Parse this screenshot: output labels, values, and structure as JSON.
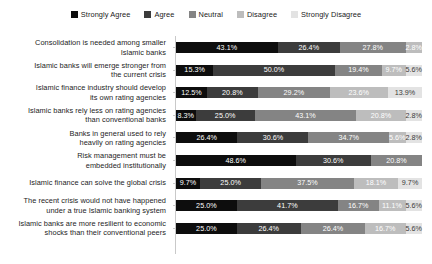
{
  "legend": {
    "position": "top",
    "items": [
      {
        "label": "Strongly Agree",
        "color": "#0d0d0d"
      },
      {
        "label": "Agree",
        "color": "#3c3c3c"
      },
      {
        "label": "Neutral",
        "color": "#848484"
      },
      {
        "label": "Disagree",
        "color": "#bdbdbd"
      },
      {
        "label": "Strongly Disagree",
        "color": "#e3e3e3"
      }
    ]
  },
  "chart_data": {
    "type": "bar",
    "orientation": "horizontal",
    "stacked": true,
    "stack_mode": "percent",
    "title": "",
    "subtitle": "",
    "xlabel": "",
    "ylabel": "",
    "xlim": [
      0,
      100
    ],
    "grid": false,
    "value_suffix": "%",
    "legend_position": "top",
    "categories": [
      "Consolidation is needed among smaller Islamic banks",
      "Islamic banks will emerge stronger from the current crisis",
      "Islamic finance industry should develop its own rating agencies",
      "Islamic banks rely less on rating agencies than conventional banks",
      "Banks in general used to rely heavily on rating agencies",
      "Risk management must be embedded institutionally",
      "Islamic finance can solve the global crisis",
      "The recent crisis would not have happened under a true Islamic banking system",
      "Islamic banks are more resilient to economic shocks than their conventional peers"
    ],
    "category_lines": [
      [
        "Consolidation is needed among smaller",
        "Islamic banks"
      ],
      [
        "Islamic banks will emerge stronger from",
        "the current crisis"
      ],
      [
        "Islamic finance industry should develop",
        "its own rating agencies"
      ],
      [
        "Islamic banks rely less on rating agencies",
        "than conventional banks"
      ],
      [
        "Banks in general used to rely",
        "heavily on rating agencies"
      ],
      [
        "Risk management must be",
        "embedded institutionally"
      ],
      [
        "Islamic finance can solve the global crisis",
        ""
      ],
      [
        "The recent crisis would not have happened",
        "under a true Islamic banking system"
      ],
      [
        "Islamic banks are more resilient to economic",
        "shocks than their conventional peers"
      ]
    ],
    "series": [
      {
        "name": "Strongly Agree",
        "color": "#0d0d0d",
        "label_color": "#ffffff",
        "values": [
          43.1,
          15.3,
          12.5,
          8.3,
          26.4,
          48.6,
          9.7,
          25.0,
          25.0
        ],
        "labels": [
          "43.1%",
          "15.3%",
          "12.5%",
          "8.3%",
          "26.4%",
          "48.6%",
          "9.7%",
          "25.0%",
          "25.0%"
        ]
      },
      {
        "name": "Agree",
        "color": "#3c3c3c",
        "label_color": "#ffffff",
        "values": [
          26.4,
          50.0,
          20.8,
          25.0,
          30.6,
          30.6,
          25.0,
          41.7,
          26.4
        ],
        "labels": [
          "26.4%",
          "50.0%",
          "20.8%",
          "25.0%",
          "30.6%",
          "30.6%",
          "25.0%",
          "41.7%",
          "26.4%"
        ]
      },
      {
        "name": "Neutral",
        "color": "#848484",
        "label_color": "#ffffff",
        "values": [
          27.8,
          19.4,
          29.2,
          43.1,
          34.7,
          20.8,
          37.5,
          16.7,
          26.4
        ],
        "labels": [
          "27.8%",
          "19.4%",
          "29.2%",
          "43.1%",
          "34.7%",
          "20.8%",
          "37.5%",
          "16.7%",
          "26.4%"
        ]
      },
      {
        "name": "Disagree",
        "color": "#bdbdbd",
        "label_color": "#ffffff",
        "values": [
          2.8,
          9.7,
          23.6,
          20.8,
          5.6,
          0,
          18.1,
          11.1,
          16.7
        ],
        "labels": [
          "2.8%",
          "9.7%",
          "23.6%",
          "20.8%",
          "5.6%",
          "",
          "18.1%",
          "11.1%",
          "16.7%"
        ]
      },
      {
        "name": "Strongly Disagree",
        "color": "#e3e3e3",
        "label_color": "#3a3a3a",
        "values": [
          0,
          5.6,
          13.9,
          2.8,
          2.8,
          0,
          9.7,
          5.6,
          5.6
        ],
        "labels": [
          "",
          "5.6%",
          "13.9%",
          "2.8%",
          "2.8%",
          "",
          "9.7%",
          "5.6%",
          "5.6%"
        ]
      }
    ]
  }
}
